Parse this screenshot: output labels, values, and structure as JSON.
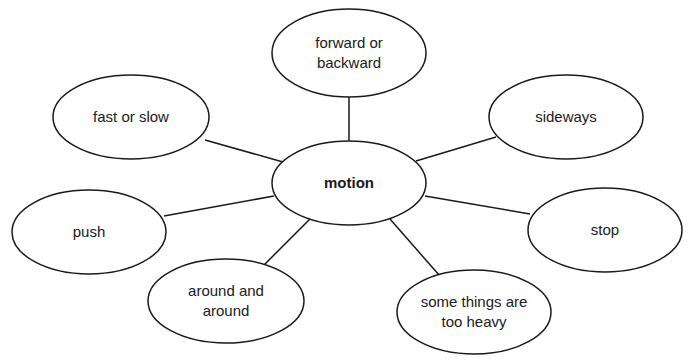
{
  "diagram": {
    "type": "concept-web",
    "center": {
      "label": "motion"
    },
    "nodes": [
      {
        "id": "forward",
        "label": "forward or\nbackward"
      },
      {
        "id": "fast",
        "label": "fast or slow"
      },
      {
        "id": "sideways",
        "label": "sideways"
      },
      {
        "id": "push",
        "label": "push"
      },
      {
        "id": "stop",
        "label": "stop"
      },
      {
        "id": "around",
        "label": "around and\naround"
      },
      {
        "id": "heavy",
        "label": "some things are\ntoo heavy"
      }
    ],
    "colors": {
      "stroke": "#1a1a1a",
      "fill": "#ffffff",
      "text": "#1a1a1a"
    }
  }
}
